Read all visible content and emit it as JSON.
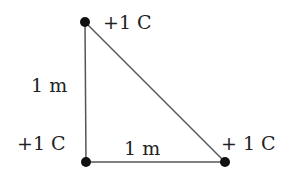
{
  "diagram": {
    "charges": [
      {
        "label": "+1 C",
        "x": 85,
        "y": 22
      },
      {
        "label": "+1 C",
        "x": 86,
        "y": 162
      },
      {
        "label": "+ 1 C",
        "x": 225,
        "y": 162
      }
    ],
    "sides": [
      {
        "label": "1 m",
        "position": "left vertical"
      },
      {
        "label": "1 m",
        "position": "bottom horizontal"
      }
    ],
    "colors": {
      "line": "#555555",
      "dot": "#111111",
      "text": "#222222"
    }
  }
}
